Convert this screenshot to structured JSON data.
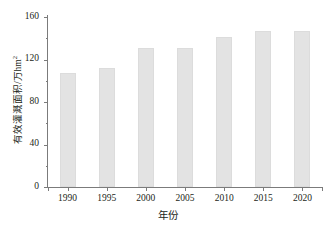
{
  "chart_data": {
    "type": "bar",
    "title": "",
    "categories": [
      "1990",
      "1995",
      "2000",
      "2005",
      "2010",
      "2015",
      "2020"
    ],
    "values": [
      107,
      112,
      131,
      131,
      141,
      147,
      147
    ],
    "series": [
      {
        "name": "有效灌溉面积",
        "values": [
          107,
          112,
          131,
          131,
          141,
          147,
          147
        ]
      }
    ],
    "xlabel": "年份",
    "ylabel_text": "有效灌溉面积/万hm",
    "ylabel_superscript": "2",
    "ylim": [
      0,
      160
    ],
    "yticks": [
      "0",
      "40",
      "80",
      "120",
      "160"
    ],
    "ytick_values": [
      0,
      40,
      80,
      120,
      160
    ],
    "yminor_tick_values": [
      20,
      60,
      100,
      140
    ],
    "xlim_categories": 7,
    "grid": "off",
    "legend": "none",
    "bar_color": "#e3e3e3",
    "bar_border_color": "#dcdcdc",
    "axis_color": "#7b7b7b",
    "text_color": "#231f20",
    "background_color": "#ffffff"
  }
}
